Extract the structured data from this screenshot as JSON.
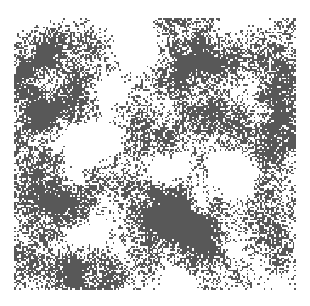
{
  "figure": {
    "title": "",
    "canvas_width": 310,
    "canvas_height": 306,
    "background_color": "#ffffff",
    "caption": "Square-lattice site percolation configuration near the critical threshold; occupied sites shown in dark gray, vacant sites in white."
  },
  "plot_area": {
    "left": 14,
    "top": 18,
    "width": 282,
    "height": 272,
    "border": "none"
  },
  "chart_data": {
    "type": "heatmap",
    "title": "",
    "subtitle": "",
    "xlabel": "",
    "ylabel": "",
    "grid": false,
    "legend_position": "none",
    "tick_labels_x": [],
    "tick_labels_y": [],
    "annotations": [],
    "colormap": {
      "occupied": "#585858",
      "vacant": "#ffffff"
    },
    "value_labels": {
      "0": "vacant",
      "1": "occupied"
    },
    "lattice": {
      "shape": "square",
      "columns": 166,
      "rows": 160,
      "cell_width_px": 1.7,
      "cell_height_px": 1.7,
      "occupancy_fraction": 0.46,
      "generator": "seeded-value-noise-threshold",
      "seed": 20240917,
      "noise": {
        "octaves": 5,
        "base_frequency": 0.055,
        "lacunarity": 2.0,
        "gain": 0.5,
        "speckle_amplitude": 0.46,
        "speckle_frequency": 1.0
      },
      "cluster_regions": [
        {
          "name": "left-edge-mass",
          "cx": 0.07,
          "cy": 0.42,
          "rx": 0.16,
          "ry": 0.46,
          "weight": 0.3
        },
        {
          "name": "upper-left-cluster",
          "cx": 0.16,
          "cy": 0.11,
          "rx": 0.17,
          "ry": 0.13,
          "weight": 0.26
        },
        {
          "name": "upper-right-band",
          "cx": 0.74,
          "cy": 0.18,
          "rx": 0.3,
          "ry": 0.16,
          "weight": 0.3
        },
        {
          "name": "right-edge-mass",
          "cx": 0.95,
          "cy": 0.4,
          "rx": 0.13,
          "ry": 0.34,
          "weight": 0.24
        },
        {
          "name": "mid-left-cluster",
          "cx": 0.17,
          "cy": 0.62,
          "rx": 0.17,
          "ry": 0.15,
          "weight": 0.26
        },
        {
          "name": "lower-center-giant",
          "cx": 0.58,
          "cy": 0.76,
          "rx": 0.3,
          "ry": 0.22,
          "weight": 0.36
        },
        {
          "name": "lower-left-cluster",
          "cx": 0.2,
          "cy": 0.93,
          "rx": 0.22,
          "ry": 0.12,
          "weight": 0.26
        },
        {
          "name": "center-diagonal-arm",
          "cx": 0.42,
          "cy": 0.36,
          "rx": 0.14,
          "ry": 0.12,
          "weight": 0.18
        },
        {
          "name": "lower-right-cluster",
          "cx": 0.92,
          "cy": 0.86,
          "rx": 0.14,
          "ry": 0.14,
          "weight": 0.22
        }
      ],
      "void_regions": [
        {
          "name": "upper-center-void",
          "cx": 0.44,
          "cy": 0.12,
          "rx": 0.18,
          "ry": 0.12,
          "weight": 0.28
        },
        {
          "name": "center-left-void",
          "cx": 0.27,
          "cy": 0.46,
          "rx": 0.15,
          "ry": 0.13,
          "weight": 0.24
        },
        {
          "name": "mid-center-void",
          "cx": 0.48,
          "cy": 0.56,
          "rx": 0.16,
          "ry": 0.1,
          "weight": 0.22
        },
        {
          "name": "right-center-void",
          "cx": 0.8,
          "cy": 0.55,
          "rx": 0.14,
          "ry": 0.11,
          "weight": 0.22
        },
        {
          "name": "lower-left-void",
          "cx": 0.22,
          "cy": 0.8,
          "rx": 0.13,
          "ry": 0.09,
          "weight": 0.2
        },
        {
          "name": "bottom-edge-void",
          "cx": 0.62,
          "cy": 0.98,
          "rx": 0.18,
          "ry": 0.06,
          "weight": 0.18
        }
      ]
    }
  }
}
